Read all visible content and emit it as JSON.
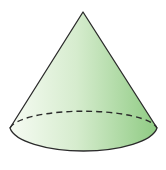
{
  "diagram": {
    "shape": "cone",
    "colors": {
      "fill_light": "#f4faf1",
      "fill_mid": "#cfe8c6",
      "fill_dark": "#8fcb83",
      "stroke": "#2b2b2b"
    },
    "hidden_edge_style": "dashed"
  }
}
